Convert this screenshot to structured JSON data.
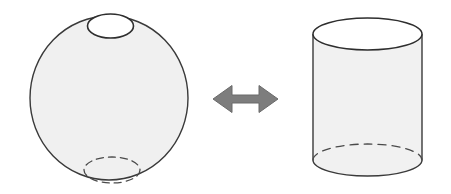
{
  "canvas": {
    "width": 451,
    "height": 194,
    "background": "#ffffff"
  },
  "figure": {
    "kind": "geometry-illustration",
    "topic": "sphere-with-two-holes is equivalent to a cylinder",
    "relation_symbol": "↔",
    "caption": "",
    "title": ""
  },
  "colors": {
    "background": "#ffffff",
    "solid_fill": "#f0f0f0",
    "cylinder_body_fill": "#f1f1f1",
    "open_face_fill": "#ffffff",
    "outline": "#3a3a3a",
    "hidden_line": "#4a4a4a",
    "arrow_fill": "#7d7d7d",
    "arrow_stroke": "#6a6a6a"
  },
  "left_shape": {
    "name": "sphere-with-holes",
    "label": "",
    "fill": "#f0f0f0",
    "stroke": "#3a3a3a",
    "stroke_width": 1.4,
    "body": {
      "cx": 109,
      "cy": 98,
      "rx": 79,
      "ry": 82
    },
    "top_hole": {
      "name": "top-opening",
      "cx": 110.5,
      "cy": 26,
      "rx": 23,
      "ry": 12,
      "fill": "#ffffff",
      "stroke": "#2e2e2e",
      "stroke_width": 1.6,
      "style": "solid"
    },
    "bottom_hole": {
      "name": "bottom-opening-hidden",
      "cx": 112,
      "cy": 170,
      "rx": 28,
      "ry": 13,
      "fill": "none",
      "stroke": "#4a4a4a",
      "stroke_width": 1.3,
      "style": "dashed",
      "dash_pattern": "7,5"
    }
  },
  "arrow": {
    "name": "double-headed-arrow",
    "direction": "both",
    "glyph": "↔",
    "fill": "#7d7d7d",
    "stroke": "#6a6a6a",
    "stroke_width": 1,
    "x_start": 213,
    "x_end": 278,
    "y_center": 99,
    "shaft_height": 8,
    "head_height": 27
  },
  "right_shape": {
    "name": "open-cylinder",
    "label": "",
    "fill": "#f1f1f1",
    "stroke": "#3a3a3a",
    "stroke_width": 1.4,
    "left_x": 313,
    "right_x": 422,
    "top_y": 34,
    "bottom_y": 160,
    "rx": 54.5,
    "ry": 16,
    "top_face": {
      "name": "cylinder-top-opening",
      "cx": 367.5,
      "cy": 34,
      "rx": 54.5,
      "ry": 16,
      "fill": "#ffffff",
      "stroke": "#2e2e2e",
      "stroke_width": 1.5,
      "style": "solid"
    },
    "bottom_front_arc": {
      "name": "cylinder-bottom-front-edge",
      "style": "solid",
      "stroke": "#3a3a3a"
    },
    "bottom_back_arc": {
      "name": "cylinder-bottom-hidden-edge",
      "style": "dashed",
      "stroke": "#4a4a4a",
      "stroke_width": 1.3,
      "dash_pattern": "8,6"
    }
  }
}
